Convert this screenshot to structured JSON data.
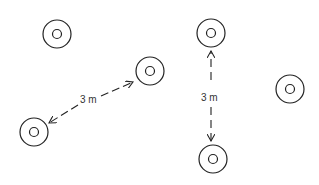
{
  "diagram": {
    "colors": {
      "stroke": "#222222",
      "text": "#333333",
      "background": "#ffffff"
    },
    "circles": [
      {
        "id": "a",
        "cx": 57,
        "cy": 34
      },
      {
        "id": "b",
        "cx": 150,
        "cy": 71
      },
      {
        "id": "c",
        "cx": 34,
        "cy": 132
      },
      {
        "id": "d",
        "cx": 211,
        "cy": 33
      },
      {
        "id": "e",
        "cx": 290,
        "cy": 89
      },
      {
        "id": "f",
        "cx": 213,
        "cy": 159
      }
    ],
    "dimensions": [
      {
        "id": "diagonal",
        "label": "3 m"
      },
      {
        "id": "vertical",
        "label": "3 m"
      }
    ]
  }
}
